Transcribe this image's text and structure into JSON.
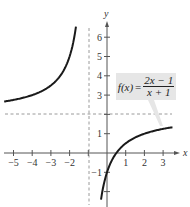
{
  "chart_data": {
    "type": "line",
    "title": "",
    "function_label": "f(x) = (2x − 1)/(x + 1)",
    "equation": {
      "lhs": "f(x)",
      "equals": "=",
      "numerator": "2x − 1",
      "denominator": "x + 1"
    },
    "xlabel": "x",
    "ylabel": "y",
    "xlim": [
      -5.5,
      3.8
    ],
    "ylim": [
      -2.5,
      7
    ],
    "x_ticks": [
      -5,
      -4,
      -3,
      -2,
      -1,
      0,
      1,
      2,
      3
    ],
    "x_tick_labels": [
      "−5",
      "−4",
      "−3",
      "−2",
      "",
      "",
      "1",
      "2",
      "3"
    ],
    "y_ticks": [
      -2,
      -1,
      1,
      2,
      3,
      4,
      5,
      6
    ],
    "y_tick_labels": [
      "",
      "−1",
      "1",
      "",
      "3",
      "4",
      "5",
      "6"
    ],
    "asymptotes": {
      "vertical": {
        "x": -1,
        "style": "dashed"
      },
      "horizontal": {
        "y": 2,
        "style": "dashed"
      }
    },
    "series": [
      {
        "name": "left branch",
        "x": [
          -5.5,
          -5,
          -4,
          -3,
          -2.5,
          -2,
          -1.8,
          -1.66
        ],
        "y": [
          2.67,
          2.75,
          3.0,
          3.5,
          4.0,
          5.0,
          5.75,
          6.55
        ]
      },
      {
        "name": "right branch",
        "x": [
          -0.32,
          -0.2,
          0,
          0.5,
          1,
          2,
          3,
          3.5
        ],
        "y": [
          -2.43,
          -1.75,
          -1.0,
          0.0,
          0.5,
          1.0,
          1.25,
          1.33
        ]
      }
    ],
    "grid": false,
    "legend": "callout box with leader line"
  },
  "axes": {
    "x_name": "x",
    "y_name": "y"
  }
}
